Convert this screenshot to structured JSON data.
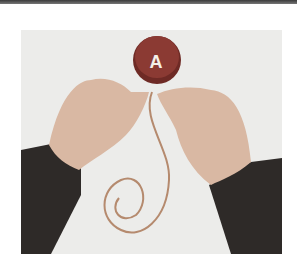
{
  "image": {
    "description": "Photo of two hands pressing a round red switch button labeled A with a coiled cable",
    "button_label": "A",
    "colors": {
      "button": "#8b3a33",
      "button_rim": "#6e2a25",
      "background": "#ececea",
      "sleeve": "#2e2a28",
      "skin": "#d9b8a3",
      "cable": "#b58a6e"
    }
  }
}
